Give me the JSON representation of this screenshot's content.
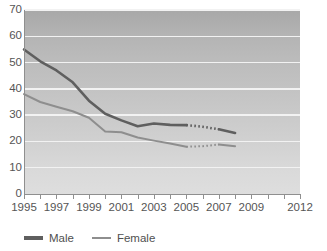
{
  "chart_data": {
    "type": "line",
    "title": "",
    "xlabel": "",
    "ylabel": "",
    "xlim": [
      1995,
      2012
    ],
    "ylim": [
      0,
      70
    ],
    "grid": true,
    "legend_position": "bottom-left",
    "y_ticks": [
      70,
      60,
      50,
      40,
      30,
      20,
      10,
      0
    ],
    "x_tick_labels": [
      "1995",
      "1997",
      "1999",
      "2001",
      "2003",
      "2005",
      "2007",
      "2009",
      "2012"
    ],
    "x_tick_label_values": [
      1995,
      1997,
      1999,
      2001,
      2003,
      2005,
      2007,
      2009,
      2012
    ],
    "x_tick_values": [
      1995,
      1996,
      1997,
      1998,
      1999,
      2000,
      2001,
      2002,
      2003,
      2004,
      2005,
      2006,
      2007,
      2008,
      2009,
      2010,
      2011,
      2012
    ],
    "x": [
      1995,
      1996,
      1997,
      1998,
      1999,
      2000,
      2001,
      2002,
      2003,
      2004,
      2005,
      2006,
      2007,
      2008
    ],
    "series": [
      {
        "name": "Male",
        "color": "#5f5f5f",
        "values": [
          55.0,
          50.5,
          47.0,
          42.5,
          35.5,
          30.5,
          28.0,
          25.8,
          26.8,
          26.3,
          26.2,
          25.6,
          24.6,
          23.2
        ],
        "solid_range": [
          1995,
          2005
        ],
        "dotted_range": [
          2005,
          2007
        ],
        "solid_range_2": [
          2007,
          2008
        ]
      },
      {
        "name": "Female",
        "color": "#8e8e8e",
        "values": [
          38.0,
          35.0,
          33.2,
          31.5,
          29.0,
          23.8,
          23.5,
          21.5,
          20.3,
          19.2,
          18.0,
          18.2,
          18.8,
          18.2
        ],
        "solid_range": [
          1995,
          2005
        ],
        "dotted_range": [
          2005,
          2007
        ],
        "solid_range_2": [
          2007,
          2008
        ]
      }
    ]
  },
  "legend": {
    "items": [
      {
        "label": "Male",
        "swatch": "male-line-swatch"
      },
      {
        "label": "Female",
        "swatch": "female-line-swatch"
      }
    ]
  },
  "colors": {
    "male": "#5f5f5f",
    "female": "#8e8e8e",
    "gridline": "#f2f2f2",
    "axis": "#8f8f8f",
    "plot_bg_top": "#a8a8a8",
    "plot_bg_bottom": "#dedede",
    "tick_text": "#555555"
  }
}
